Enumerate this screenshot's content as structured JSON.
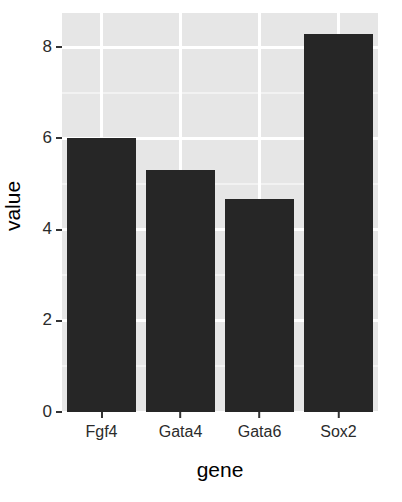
{
  "chart_data": {
    "type": "bar",
    "title": "",
    "subtitle": "",
    "xlabel": "gene",
    "ylabel": "value",
    "categories": [
      "Fgf4",
      "Gata4",
      "Gata6",
      "Sox2"
    ],
    "values": [
      6.0,
      5.3,
      4.67,
      8.3
    ],
    "ylim": [
      0,
      8.75
    ],
    "xlim_categories": 4,
    "y_ticks": [
      0,
      2,
      4,
      6,
      8
    ],
    "y_tick_labels": [
      "0",
      "2",
      "4",
      "6",
      "8"
    ],
    "y_minor_ticks": [
      1,
      3,
      5,
      7
    ],
    "grid": true,
    "grid_major_color": "#ffffff",
    "grid_minor_color": "#f2f2f2",
    "panel_background": "#e6e6e6",
    "bar_color": "#262626",
    "legend": null,
    "legend_position": "none",
    "annotations": []
  },
  "axes": {
    "y_title": "value",
    "x_title": "gene"
  }
}
